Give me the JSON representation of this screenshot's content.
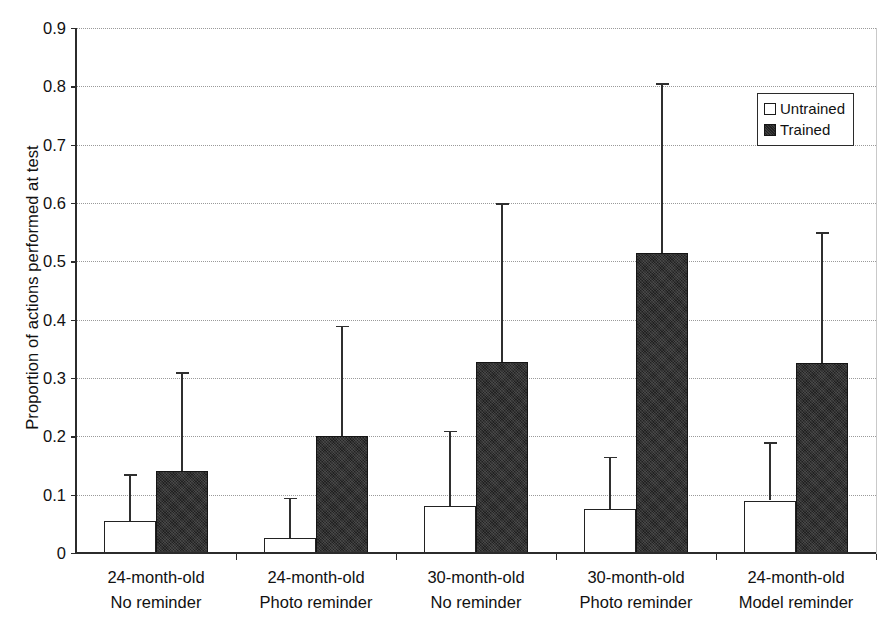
{
  "chart_data": {
    "type": "bar",
    "title": "",
    "xlabel": "",
    "ylabel": "Proportion of actions performed at test",
    "ylim": [
      0,
      0.9
    ],
    "ytick_labels": [
      "0",
      "0.1",
      "0.2",
      "0.3",
      "0.4",
      "0.5",
      "0.6",
      "0.7",
      "0.8",
      "0.9"
    ],
    "ytick_values": [
      0,
      0.1,
      0.2,
      0.3,
      0.4,
      0.5,
      0.6,
      0.7,
      0.8,
      0.9
    ],
    "grid": true,
    "legend_position": "top-right",
    "categories": [
      "24-month-old\nNo reminder",
      "24-month-old\nPhoto reminder",
      "30-month-old\nNo reminder",
      "30-month-old\nPhoto reminder",
      "24-month-old\nModel reminder"
    ],
    "category_lines": [
      [
        "24-month-old",
        "No reminder"
      ],
      [
        "24-month-old",
        "Photo reminder"
      ],
      [
        "30-month-old",
        "No reminder"
      ],
      [
        "30-month-old",
        "Photo reminder"
      ],
      [
        "24-month-old",
        "Model reminder"
      ]
    ],
    "series": [
      {
        "name": "Untrained",
        "color": "#ffffff",
        "values": [
          0.055,
          0.025,
          0.08,
          0.075,
          0.09
        ],
        "error_upper": [
          0.135,
          0.095,
          0.21,
          0.165,
          0.19
        ]
      },
      {
        "name": "Trained",
        "color": "#212121",
        "values": [
          0.14,
          0.2,
          0.327,
          0.515,
          0.325
        ],
        "error_upper": [
          0.31,
          0.39,
          0.6,
          0.805,
          0.55
        ]
      }
    ]
  },
  "legend": {
    "entries": [
      {
        "label": "Untrained",
        "swatch": "hollow-square"
      },
      {
        "label": "Trained",
        "swatch": "filled-square"
      }
    ]
  }
}
